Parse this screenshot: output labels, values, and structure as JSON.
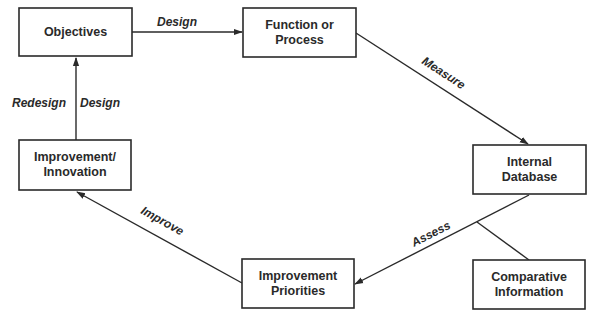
{
  "nodes": {
    "objectives": {
      "lines": [
        "Objectives"
      ]
    },
    "function": {
      "lines": [
        "Function or",
        "Process"
      ]
    },
    "database": {
      "lines": [
        "Internal",
        "Database"
      ]
    },
    "comparative": {
      "lines": [
        "Comparative",
        "Information"
      ]
    },
    "priorities": {
      "lines": [
        "Improvement",
        "Priorities"
      ]
    },
    "innovation": {
      "lines": [
        "Improvement/",
        "Innovation"
      ]
    }
  },
  "edges": {
    "design_top": "Design",
    "measure": "Measure",
    "assess": "Assess",
    "improve": "Improve",
    "redesign": "Redesign",
    "design_left": "Design"
  },
  "colors": {
    "stroke": "#2a2a2a",
    "background": "#ffffff"
  }
}
